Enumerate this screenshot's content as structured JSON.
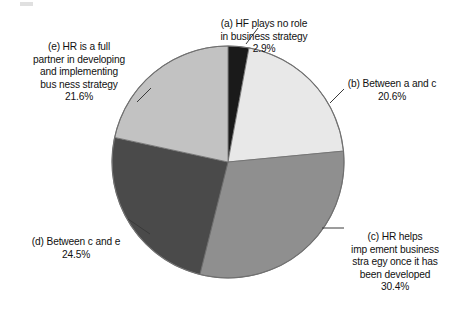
{
  "chart_data": {
    "type": "pie",
    "title": "",
    "subtitle": "",
    "xlabel": "",
    "ylabel": "",
    "legend_position": "callout-labels",
    "grid": false,
    "start_angle_deg": 0,
    "direction": "clockwise",
    "center": {
      "x": 228,
      "y": 162
    },
    "radius": 116,
    "units": "percent",
    "categories": [
      "(a) HF plays no role in business strategy",
      "(b) Between a and c",
      "(c) HR helps implement business strategy once it has been developed",
      "(d) Between c and e",
      "(e) HR is a full partner in developing and implementing business strategy"
    ],
    "values": [
      2.9,
      20.6,
      30.4,
      24.5,
      21.6
    ],
    "colors": [
      "#1a1a1a",
      "#e8e8e8",
      "#8f8f8f",
      "#4a4a4a",
      "#c2c2c2"
    ],
    "slices": [
      {
        "key": "a",
        "label": "(a) HF plays no role\nin business strategy",
        "percent_text": "2.9%",
        "value": 2.9,
        "color": "#1a1a1a",
        "start_angle_deg": 0.0,
        "end_angle_deg": 10.44
      },
      {
        "key": "b",
        "label": "(b) Between a and c",
        "percent_text": "20.6%",
        "value": 20.6,
        "color": "#e8e8e8",
        "start_angle_deg": 10.44,
        "end_angle_deg": 84.6
      },
      {
        "key": "c",
        "label": "(c) HR helps\nimp ement business\nstra egy once it has\nbeen developed",
        "percent_text": "30.4%",
        "value": 30.4,
        "color": "#8f8f8f",
        "start_angle_deg": 84.6,
        "end_angle_deg": 194.04
      },
      {
        "key": "d",
        "label": "(d) Between c and e",
        "percent_text": "24.5%",
        "value": 24.5,
        "color": "#4a4a4a",
        "start_angle_deg": 194.04,
        "end_angle_deg": 282.24
      },
      {
        "key": "e",
        "label": "(e) HR is a full\npartner in developing\nand implementing\nbus ness strategy",
        "percent_text": "21.6%",
        "value": 21.6,
        "color": "#c2c2c2",
        "start_angle_deg": 282.24,
        "end_angle_deg": 360.0
      }
    ]
  },
  "labels": {
    "a": {
      "text": "(a) HF plays no role\nin business strategy",
      "percent": "2.9%"
    },
    "b": {
      "text": "(b) Between a and c",
      "percent": "20.6%"
    },
    "c": {
      "text": "(c) HR helps\nimp ement business\nstra egy once it has\nbeen developed",
      "percent": "30.4%"
    },
    "d": {
      "text": "(d) Between c and e",
      "percent": "24.5%"
    },
    "e": {
      "text": "(e) HR is a full\npartner in developing\nand implementing\nbus ness strategy",
      "percent": "21.6%"
    }
  },
  "style": {
    "background": "#ffffff",
    "text_color": "#111111",
    "leader_line_color": "#3a3a3a",
    "slice_outline": "#6e6e6e"
  }
}
